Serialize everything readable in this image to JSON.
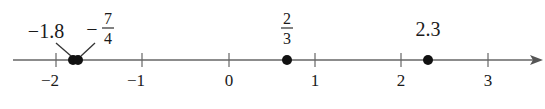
{
  "diagram": {
    "type": "number-line",
    "axis": {
      "min_drawn": -2.5,
      "max_drawn": 3.6,
      "arrow_direction": "right",
      "ticks": [
        {
          "value": -2,
          "label": "−2"
        },
        {
          "value": -1,
          "label": "−1"
        },
        {
          "value": 0,
          "label": "0"
        },
        {
          "value": 1,
          "label": "1"
        },
        {
          "value": 2,
          "label": "2"
        },
        {
          "value": 3,
          "label": "3"
        }
      ]
    },
    "points": [
      {
        "value": -1.8,
        "label": "−1.8",
        "label_type": "decimal"
      },
      {
        "value": -1.75,
        "label": "−7/4",
        "label_type": "fraction",
        "sign": "−",
        "numerator": "7",
        "denominator": "4"
      },
      {
        "value": 0.6667,
        "label": "2/3",
        "label_type": "fraction",
        "sign": "",
        "numerator": "2",
        "denominator": "3"
      },
      {
        "value": 2.3,
        "label": "2.3",
        "label_type": "decimal"
      }
    ],
    "colors": {
      "line": "#555555",
      "point": "#111111",
      "text": "#1a1a1a"
    }
  }
}
